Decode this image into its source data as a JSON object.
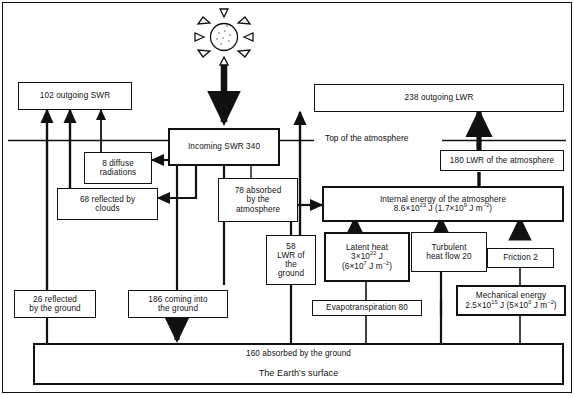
{
  "diagram": {
    "reference_lines": {
      "top_of_atmosphere_label": "Top of the atmosphere"
    },
    "sun": {
      "icon": "sun-icon",
      "rays": 8
    },
    "boxes": {
      "outgoing_swr": {
        "label": "102 outgoing SWR"
      },
      "outgoing_lwr": {
        "label": "238 outgoing LWR"
      },
      "incoming_swr": {
        "label": "Incoming SWR  340"
      },
      "diffuse_radiations": {
        "line1": "8 diffuse",
        "line2": "radiations"
      },
      "reflected_by_clouds": {
        "line1": "68 reflected by",
        "line2": "clouds"
      },
      "absorbed_by_atmosphere": {
        "line1": "78 absorbed",
        "line2": "by the",
        "line3": "atmosphere"
      },
      "lwr_of_atmosphere": {
        "label": "180 LWR of the atmosphere"
      },
      "internal_energy": {
        "line1": "Internal energy of the atmosphere",
        "value_mantissa": "8.6×10",
        "value_exponent": "23",
        "value_unit": " J (1.7×10",
        "value_exponent2": "9",
        "value_unit2": " J m",
        "value_exponent3": "−2",
        "value_close": ")"
      },
      "lwr_of_ground": {
        "line1": "58",
        "line2": "LWR of",
        "line3": "the",
        "line4": "ground"
      },
      "latent_heat": {
        "line1": "Latent heat",
        "mantissa": "3×10",
        "exponent": "22",
        "unit": " J",
        "line3_open": "(6×10",
        "exponent2": "7",
        "unit2": " J m",
        "exponent3": "−2",
        "close": ")"
      },
      "turbulent_heat_flow": {
        "line1": "Turbulent",
        "line2": "heat flow  20"
      },
      "friction": {
        "label": "Friction 2"
      },
      "mechanical_energy": {
        "line1": "Mechanical energy",
        "mantissa": "2.5×10",
        "exponent": "15",
        "unit": " J (5×10",
        "exponent2": "0",
        "unit2": " J m",
        "exponent3": "−2",
        "close": ")"
      },
      "reflected_by_ground": {
        "line1": "26 reflected",
        "line2": "by the ground"
      },
      "coming_into_ground": {
        "line1": "186 coming into",
        "line2": "the ground"
      },
      "evapotranspiration": {
        "label": "Evapotranspiration 80"
      },
      "absorbed_by_ground": {
        "label": "160 absorbed by the ground"
      },
      "earths_surface": {
        "label": "The Earth's surface"
      }
    },
    "colors": {
      "stroke": "#111111",
      "background": "#ffffff",
      "dot_fill": "#4a4a4a"
    }
  }
}
